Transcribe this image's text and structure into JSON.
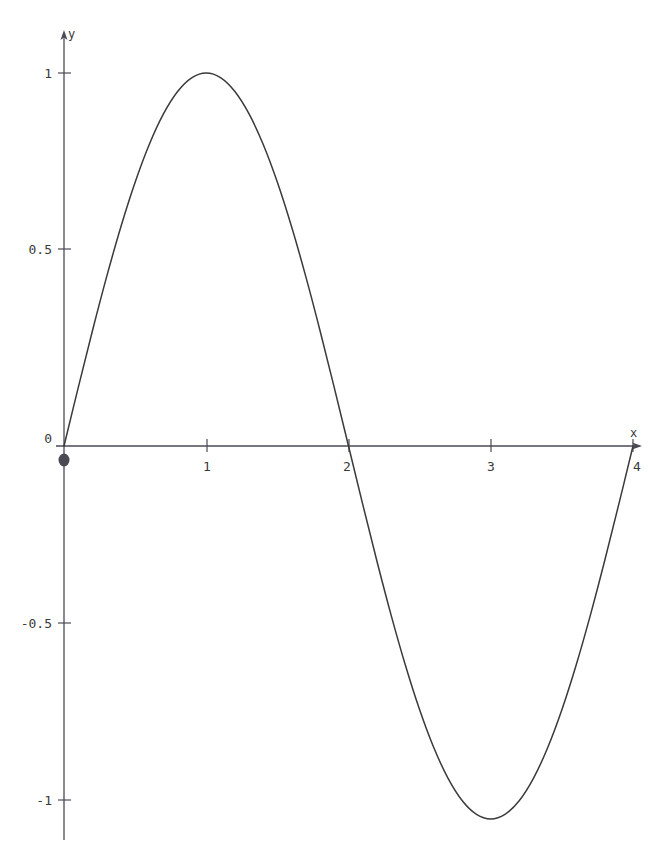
{
  "chart_data": {
    "type": "line",
    "title": "",
    "xlabel": "x",
    "ylabel": "y",
    "function": "y = sin(pi*x/2)",
    "xlim": [
      0,
      4
    ],
    "ylim": [
      -1,
      1
    ],
    "grid": false,
    "legend": null,
    "axis_style": "arrow-axes-through-origin",
    "x_ticks": [
      {
        "value": 0,
        "label": "0"
      },
      {
        "value": 1,
        "label": "1"
      },
      {
        "value": 2,
        "label": "2"
      },
      {
        "value": 3,
        "label": "3"
      },
      {
        "value": 4,
        "label": "4"
      }
    ],
    "y_ticks": [
      {
        "value": 1,
        "label": "1"
      },
      {
        "value": 0.5,
        "label": "0.5"
      },
      {
        "value": 0,
        "label": "0"
      },
      {
        "value": -0.5,
        "label": "-0.5"
      },
      {
        "value": -1,
        "label": "-1"
      }
    ],
    "markers": [
      {
        "x": 0,
        "y": 0,
        "style": "filled-dot"
      }
    ],
    "series": [
      {
        "name": "sine",
        "color": "#3a3a3a",
        "x": [
          0,
          0.1,
          0.2,
          0.3,
          0.4,
          0.5,
          0.6,
          0.7,
          0.8,
          0.9,
          1,
          1.1,
          1.2,
          1.3,
          1.4,
          1.5,
          1.6,
          1.7,
          1.8,
          1.9,
          2,
          2.1,
          2.2,
          2.3,
          2.4,
          2.5,
          2.6,
          2.7,
          2.8,
          2.9,
          3,
          3.1,
          3.2,
          3.3,
          3.4,
          3.5,
          3.6,
          3.7,
          3.8,
          3.9,
          4
        ],
        "y": [
          0,
          0.1564,
          0.309,
          0.454,
          0.5878,
          0.7071,
          0.809,
          0.891,
          0.9511,
          0.9877,
          1,
          0.9877,
          0.9511,
          0.891,
          0.809,
          0.7071,
          0.5878,
          0.454,
          0.309,
          0.1564,
          0,
          -0.1564,
          -0.309,
          -0.454,
          -0.5878,
          -0.7071,
          -0.809,
          -0.891,
          -0.9511,
          -0.9877,
          -1,
          -0.9877,
          -0.9511,
          -0.891,
          -0.809,
          -0.7071,
          -0.5878,
          -0.454,
          -0.309,
          -0.1564,
          0
        ]
      }
    ],
    "colors": {
      "axis": "#4a4a55",
      "curve": "#3a3a3a",
      "text": "#3a3a3a",
      "background": "#ffffff"
    }
  }
}
